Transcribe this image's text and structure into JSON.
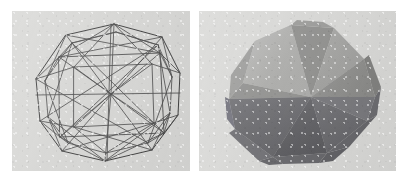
{
  "figure": {
    "background_color": "#ffffff",
    "panel_background_color": "#d9d9d7",
    "panel_count": 2
  },
  "panels": [
    {
      "id": "wireframe",
      "name": "wireframe-rendering",
      "caption": "",
      "render_mode": "wireframe",
      "line_color": "#4a4a4a",
      "background_color": "#d9d9d7",
      "x": 12,
      "y": 11,
      "width": 178,
      "height": 160,
      "object": {
        "name": "triangulated polyhedron",
        "vertex_count": 24,
        "edge_count": 60,
        "face_count": 38,
        "silhouette": "octagonal",
        "projection": "perspective"
      }
    },
    {
      "id": "shaded",
      "name": "flat-shaded-rendering",
      "caption": "",
      "render_mode": "flat-shaded",
      "background_color": "#d9d9d7",
      "x": 199,
      "y": 11,
      "width": 197,
      "height": 160,
      "object": {
        "name": "triangulated polyhedron",
        "silhouette": "octagonal",
        "projection": "perspective",
        "light_direction": "upper-left"
      },
      "facet_tones": {
        "highlight": "#b4b4b2",
        "light": "#a2a2a0",
        "mid_light": "#949492",
        "mid": "#8a8a88",
        "mid_dark": "#7c7c7a",
        "dark": "#6e6e6c",
        "darker": "#636361",
        "darkest": "#58585a"
      }
    }
  ],
  "chart_data": {
    "type": "scatter",
    "xlabel": "",
    "ylabel": "",
    "series": [
      {
        "name": "wireframe-vertices",
        "x": [
          54,
          89,
          125,
          152,
          163,
          151,
          122,
          79,
          48,
          34,
          41,
          68,
          100,
          140,
          160,
          167,
          152,
          118,
          78,
          46,
          31,
          101,
          104,
          99
        ],
        "y": [
          26,
          18,
          22,
          41,
          72,
          108,
          136,
          150,
          143,
          112,
          74,
          46,
          36,
          52,
          80,
          104,
          130,
          146,
          140,
          120,
          83,
          45,
          90,
          128
        ]
      }
    ]
  }
}
